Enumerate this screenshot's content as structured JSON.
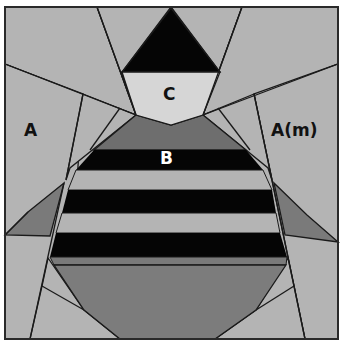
{
  "figure": {
    "labels": {
      "a_left": "A",
      "a_right": "A(m)",
      "b": "B",
      "c": "C"
    },
    "colors": {
      "background": "#ffffff",
      "light_gray": "#b4b4b4",
      "pale_gray": "#d6d6d6",
      "mid_gray": "#7a7a7a",
      "body_gray": "#808080",
      "black": "#050505",
      "outline": "#1a1a1a",
      "label_dark": "#111111",
      "label_light": "#ffffff"
    }
  }
}
